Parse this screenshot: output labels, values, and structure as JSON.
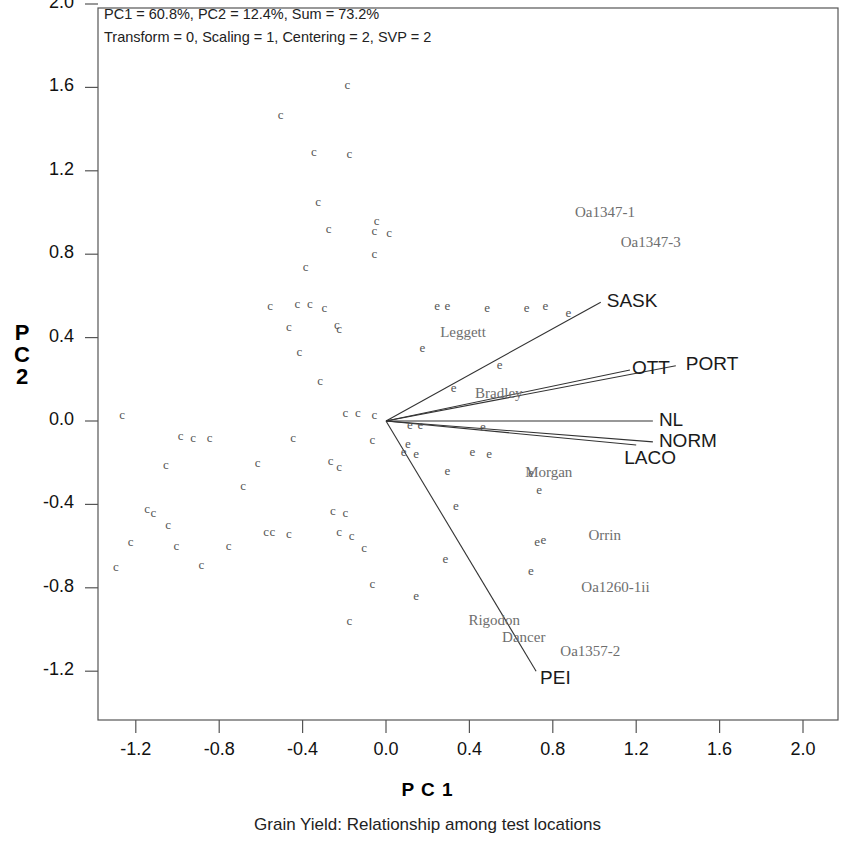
{
  "header": {
    "line1": "PC1 = 60.8%, PC2 = 12.4%, Sum = 73.2%",
    "line2": "Transform = 0, Scaling = 1, Centering = 2, SVP = 2"
  },
  "axes": {
    "x_title": "P C 1",
    "y_title_chars": [
      "P",
      "C",
      "2"
    ],
    "caption": "Grain Yield: Relationship among test locations"
  },
  "chart_data": {
    "type": "scatter",
    "title": "Grain Yield: Relationship among test locations",
    "subtitle": "PC1 = 60.8%, PC2 = 12.4%, Sum = 73.2%",
    "annotations": [
      "PC1 = 60.8%, PC2 = 12.4%, Sum = 73.2%",
      "Transform = 0, Scaling = 1, Centering = 2, SVP = 2"
    ],
    "xlabel": "P C 1",
    "ylabel": "P C 2",
    "xlim": [
      -1.45,
      2.18
    ],
    "ylim": [
      -1.42,
      2.0
    ],
    "xticks": [
      -1.2,
      -0.8,
      -0.4,
      0.0,
      0.4,
      0.8,
      1.2,
      1.6,
      2.0
    ],
    "yticks": [
      2.0,
      1.6,
      1.2,
      0.8,
      0.4,
      0.0,
      -0.4,
      -0.8,
      -1.2
    ],
    "xtick_labels": [
      "-1.2",
      "-0.8",
      "-0.4",
      "0.0",
      "0.4",
      "0.8",
      "1.2",
      "1.6",
      "2.0"
    ],
    "ytick_labels": [
      "2.0",
      "1.6",
      "1.2",
      "0.8",
      "0.4",
      "0.0",
      "-0.4",
      "-0.8",
      "-1.2"
    ],
    "grid": false,
    "legend": "none",
    "variance_explained": {
      "PC1": 60.8,
      "PC2": 12.4,
      "sum": 73.2
    },
    "model_settings": {
      "transform": 0,
      "scaling": 1,
      "centering": 2,
      "svp": 2
    },
    "origin": [
      0.0,
      0.0
    ],
    "environment_vectors": [
      {
        "label": "SASK",
        "x": 1.03,
        "y": 0.57
      },
      {
        "label": "PORT",
        "x": 1.39,
        "y": 0.265
      },
      {
        "label": "OTT",
        "x": 1.17,
        "y": 0.245
      },
      {
        "label": "NL",
        "x": 1.28,
        "y": 0.0
      },
      {
        "label": "NORM",
        "x": 1.28,
        "y": -0.1
      },
      {
        "label": "LACO",
        "x": 1.2,
        "y": -0.115
      },
      {
        "label": "PEI",
        "x": 0.72,
        "y": -1.2
      }
    ],
    "genotype_labels": [
      {
        "label": "Oa1347-1",
        "x": 1.05,
        "y": 1.0
      },
      {
        "label": "Oa1347-3",
        "x": 1.27,
        "y": 0.855
      },
      {
        "label": "Leggett",
        "x": 0.37,
        "y": 0.42
      },
      {
        "label": "Bradley",
        "x": 0.54,
        "y": 0.13
      },
      {
        "label": "Morgan",
        "x": 0.78,
        "y": -0.25
      },
      {
        "label": "Orrin",
        "x": 1.05,
        "y": -0.55
      },
      {
        "label": "Oa1260-1ii",
        "x": 1.1,
        "y": -0.8
      },
      {
        "label": "Rigodon",
        "x": 0.52,
        "y": -0.96
      },
      {
        "label": "Dancer",
        "x": 0.66,
        "y": -1.04
      },
      {
        "label": "Oa1357-2",
        "x": 0.98,
        "y": -1.11
      }
    ],
    "marker_glyphs": {
      "c": "c",
      "e": "e"
    },
    "points": [
      {
        "g": "c",
        "x": -0.18,
        "y": 1.61
      },
      {
        "g": "c",
        "x": -0.5,
        "y": 1.47
      },
      {
        "g": "c",
        "x": -0.34,
        "y": 1.29
      },
      {
        "g": "c",
        "x": -0.17,
        "y": 1.28
      },
      {
        "g": "c",
        "x": -0.32,
        "y": 1.05
      },
      {
        "g": "c",
        "x": -0.04,
        "y": 0.96
      },
      {
        "g": "c",
        "x": -0.27,
        "y": 0.92
      },
      {
        "g": "c",
        "x": -0.05,
        "y": 0.91
      },
      {
        "g": "c",
        "x": 0.02,
        "y": 0.9
      },
      {
        "g": "c",
        "x": -0.05,
        "y": 0.8
      },
      {
        "g": "c",
        "x": -0.38,
        "y": 0.74
      },
      {
        "g": "c",
        "x": -0.55,
        "y": 0.55
      },
      {
        "g": "c",
        "x": -0.42,
        "y": 0.56
      },
      {
        "g": "c",
        "x": -0.36,
        "y": 0.56
      },
      {
        "g": "c",
        "x": -0.29,
        "y": 0.54
      },
      {
        "g": "e",
        "x": 0.25,
        "y": 0.55
      },
      {
        "g": "e",
        "x": 0.3,
        "y": 0.55
      },
      {
        "g": "e",
        "x": 0.49,
        "y": 0.54
      },
      {
        "g": "e",
        "x": 0.68,
        "y": 0.54
      },
      {
        "g": "e",
        "x": 0.77,
        "y": 0.55
      },
      {
        "g": "e",
        "x": 0.88,
        "y": 0.52
      },
      {
        "g": "c",
        "x": -0.46,
        "y": 0.45
      },
      {
        "g": "c",
        "x": -0.23,
        "y": 0.46
      },
      {
        "g": "c",
        "x": -0.22,
        "y": 0.44
      },
      {
        "g": "e",
        "x": 0.18,
        "y": 0.35
      },
      {
        "g": "c",
        "x": -0.41,
        "y": 0.33
      },
      {
        "g": "e",
        "x": 0.55,
        "y": 0.27
      },
      {
        "g": "c",
        "x": -0.31,
        "y": 0.19
      },
      {
        "g": "e",
        "x": 0.33,
        "y": 0.16
      },
      {
        "g": "c",
        "x": -0.19,
        "y": 0.04
      },
      {
        "g": "c",
        "x": -0.13,
        "y": 0.04
      },
      {
        "g": "c",
        "x": -0.05,
        "y": 0.03
      },
      {
        "g": "c",
        "x": -1.26,
        "y": 0.03
      },
      {
        "g": "e",
        "x": 0.12,
        "y": -0.02
      },
      {
        "g": "e",
        "x": 0.17,
        "y": -0.02
      },
      {
        "g": "e",
        "x": 0.47,
        "y": -0.03
      },
      {
        "g": "c",
        "x": -0.98,
        "y": -0.07
      },
      {
        "g": "c",
        "x": -0.92,
        "y": -0.08
      },
      {
        "g": "c",
        "x": -0.84,
        "y": -0.08
      },
      {
        "g": "c",
        "x": -0.44,
        "y": -0.08
      },
      {
        "g": "c",
        "x": -0.06,
        "y": -0.09
      },
      {
        "g": "e",
        "x": 0.11,
        "y": -0.11
      },
      {
        "g": "e",
        "x": 0.09,
        "y": -0.15
      },
      {
        "g": "e",
        "x": 0.15,
        "y": -0.16
      },
      {
        "g": "e",
        "x": 0.42,
        "y": -0.15
      },
      {
        "g": "e",
        "x": 0.5,
        "y": -0.16
      },
      {
        "g": "c",
        "x": -1.05,
        "y": -0.21
      },
      {
        "g": "c",
        "x": -0.61,
        "y": -0.2
      },
      {
        "g": "c",
        "x": -0.26,
        "y": -0.19
      },
      {
        "g": "c",
        "x": -0.22,
        "y": -0.22
      },
      {
        "g": "e",
        "x": 0.3,
        "y": -0.24
      },
      {
        "g": "e",
        "x": 0.7,
        "y": -0.25
      },
      {
        "g": "c",
        "x": -0.68,
        "y": -0.31
      },
      {
        "g": "e",
        "x": 0.74,
        "y": -0.33
      },
      {
        "g": "c",
        "x": -1.14,
        "y": -0.42
      },
      {
        "g": "c",
        "x": -1.11,
        "y": -0.44
      },
      {
        "g": "c",
        "x": -0.25,
        "y": -0.43
      },
      {
        "g": "c",
        "x": -0.19,
        "y": -0.44
      },
      {
        "g": "e",
        "x": 0.34,
        "y": -0.41
      },
      {
        "g": "c",
        "x": -1.04,
        "y": -0.5
      },
      {
        "g": "c",
        "x": -0.57,
        "y": -0.53
      },
      {
        "g": "c",
        "x": -0.54,
        "y": -0.53
      },
      {
        "g": "c",
        "x": -0.46,
        "y": -0.54
      },
      {
        "g": "c",
        "x": -0.22,
        "y": -0.53
      },
      {
        "g": "c",
        "x": -0.16,
        "y": -0.55
      },
      {
        "g": "e",
        "x": 0.73,
        "y": -0.58
      },
      {
        "g": "e",
        "x": 0.76,
        "y": -0.57
      },
      {
        "g": "c",
        "x": -1.22,
        "y": -0.58
      },
      {
        "g": "c",
        "x": -1.0,
        "y": -0.6
      },
      {
        "g": "c",
        "x": -0.75,
        "y": -0.6
      },
      {
        "g": "c",
        "x": -0.1,
        "y": -0.61
      },
      {
        "g": "e",
        "x": 0.29,
        "y": -0.66
      },
      {
        "g": "c",
        "x": -1.29,
        "y": -0.7
      },
      {
        "g": "c",
        "x": -0.88,
        "y": -0.69
      },
      {
        "g": "e",
        "x": 0.7,
        "y": -0.72
      },
      {
        "g": "c",
        "x": -0.06,
        "y": -0.78
      },
      {
        "g": "e",
        "x": 0.15,
        "y": -0.84
      },
      {
        "g": "c",
        "x": -0.17,
        "y": -0.96
      }
    ]
  }
}
